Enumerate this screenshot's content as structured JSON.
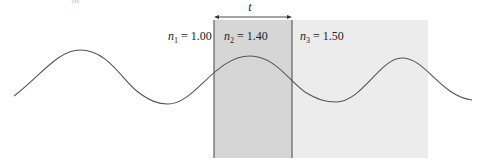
{
  "figure": {
    "top_fragment": "m",
    "thickness_label": "t",
    "regions": [
      {
        "id": "n1",
        "symbol": "n",
        "subscript": "1",
        "value": "= 1.00",
        "fill": "#ffffff"
      },
      {
        "id": "n2",
        "symbol": "n",
        "subscript": "2",
        "value": "= 1.40",
        "fill": "#d6d6d6"
      },
      {
        "id": "n3",
        "symbol": "n",
        "subscript": "3",
        "value": "= 1.50",
        "fill": "#ececec"
      }
    ],
    "colors": {
      "wave": "#555555",
      "boundary": "#444444",
      "arrow": "#333333"
    }
  }
}
